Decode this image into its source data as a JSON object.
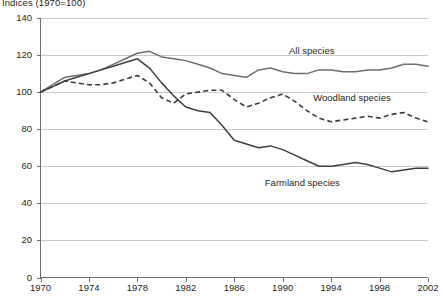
{
  "chart_data": {
    "type": "line",
    "title": "Indices (1970=100)",
    "xlabel": "",
    "ylabel": "",
    "ylim": [
      0,
      140
    ],
    "xlim": [
      1970,
      2002
    ],
    "yticks": [
      0,
      20,
      40,
      60,
      80,
      100,
      120,
      140
    ],
    "xticks": [
      1970,
      1974,
      1978,
      1982,
      1986,
      1990,
      1994,
      1998,
      2002
    ],
    "grid": "horizontal",
    "legend_position": "inline-annotations",
    "x": [
      1970,
      1971,
      1972,
      1973,
      1974,
      1975,
      1976,
      1977,
      1978,
      1979,
      1980,
      1981,
      1982,
      1983,
      1984,
      1985,
      1986,
      1987,
      1988,
      1989,
      1990,
      1991,
      1992,
      1993,
      1994,
      1995,
      1996,
      1997,
      1998,
      1999,
      2000,
      2001,
      2002
    ],
    "series": [
      {
        "name": "All species",
        "style": "solid",
        "color": "#6d6e71",
        "values": [
          100,
          104,
          108,
          109,
          110,
          112,
          115,
          118,
          121,
          122,
          119,
          118,
          117,
          115,
          113,
          110,
          109,
          108,
          112,
          113,
          111,
          110,
          110,
          112,
          112,
          111,
          111,
          112,
          112,
          113,
          115,
          115,
          114
        ]
      },
      {
        "name": "Woodland species",
        "style": "dashed",
        "color": "#3b3b3b",
        "values": [
          100,
          103,
          106,
          105,
          104,
          104,
          105,
          107,
          109,
          105,
          97,
          94,
          99,
          100,
          101,
          101,
          96,
          92,
          94,
          97,
          99,
          95,
          90,
          86,
          84,
          85,
          86,
          87,
          86,
          88,
          89,
          86,
          84
        ]
      },
      {
        "name": "Farmland species",
        "style": "solid",
        "color": "#3f3f3f",
        "values": [
          100,
          103,
          106,
          108,
          110,
          112,
          114,
          116,
          118,
          113,
          105,
          98,
          92,
          90,
          89,
          82,
          74,
          72,
          70,
          71,
          69,
          66,
          63,
          60,
          60,
          61,
          62,
          61,
          59,
          57,
          58,
          59,
          59
        ]
      }
    ],
    "annotations": [
      {
        "text": "All species",
        "x": 1993,
        "y": 122
      },
      {
        "text": "Woodland species",
        "x": 1995,
        "y": 97
      },
      {
        "text": "Farmland species",
        "x": 1991,
        "y": 51
      }
    ]
  }
}
